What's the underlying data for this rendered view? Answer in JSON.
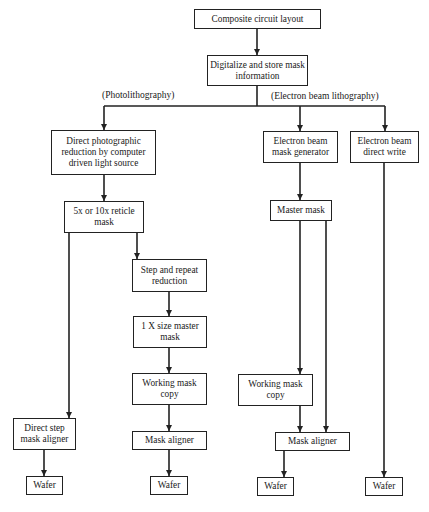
{
  "nodes": {
    "composite": "Composite circuit layout",
    "digitalize": "Digitalize and store mask information",
    "direct_photo": "Direct photographic reduction by computer driven light source",
    "reticle": "5x or 10x reticle mask",
    "step_repeat": "Step and repeat reduction",
    "one_x_master": "1 X size master mask",
    "working_copy_photo": "Working mask copy",
    "direct_step_aligner": "Direct step mask aligner",
    "mask_aligner_photo": "Mask aligner",
    "wafer_1": "Wafer",
    "wafer_2": "Wafer",
    "eb_mask_gen": "Electron beam mask generator",
    "eb_direct_write": "Electron beam direct write",
    "master_mask": "Master mask",
    "working_copy_eb": "Working mask copy",
    "mask_aligner_eb": "Mask aligner",
    "wafer_3": "Wafer",
    "wafer_4": "Wafer"
  },
  "branch_labels": {
    "photolithography": "(Photolithography)",
    "electron_beam": "(Electron beam lithography)"
  },
  "colors": {
    "line": "#222222",
    "background": "#ffffff"
  }
}
